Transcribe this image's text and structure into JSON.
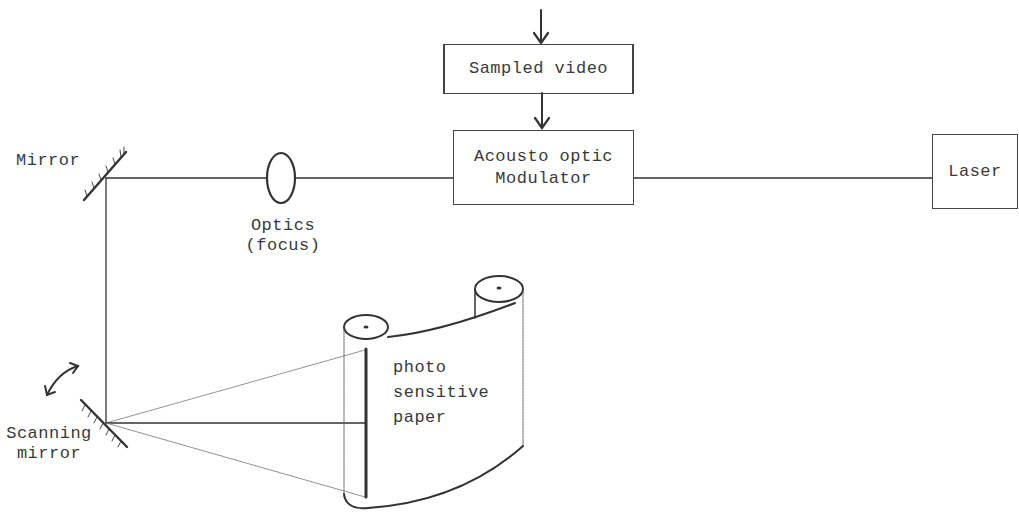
{
  "diagram": {
    "type": "laser-scanner-recorder-schematic",
    "blocks": {
      "sampled_video": "Sampled video",
      "modulator_line1": "Acousto optic",
      "modulator_line2": "Modulator",
      "laser": "Laser"
    },
    "labels": {
      "mirror": "Mirror",
      "optics_line1": "Optics",
      "optics_line2": "(focus)",
      "scanning_line1": "Scanning",
      "scanning_line2": "mirror",
      "paper_line1": "photo",
      "paper_line2": "sensitive",
      "paper_line3": "paper"
    },
    "connections": [
      {
        "from": "input",
        "to": "Sampled video",
        "style": "arrow"
      },
      {
        "from": "Sampled video",
        "to": "Acousto optic Modulator",
        "style": "arrow"
      },
      {
        "from": "Laser",
        "to": "Acousto optic Modulator",
        "style": "line"
      },
      {
        "from": "Acousto optic Modulator",
        "to": "Optics (focus)",
        "style": "line"
      },
      {
        "from": "Optics (focus)",
        "to": "Mirror",
        "style": "line"
      },
      {
        "from": "Mirror",
        "to": "Scanning mirror",
        "style": "line"
      },
      {
        "from": "Scanning mirror",
        "to": "photo sensitive paper",
        "style": "fan-beam"
      }
    ],
    "colors": {
      "ink": "#333333",
      "background": "#ffffff"
    }
  }
}
